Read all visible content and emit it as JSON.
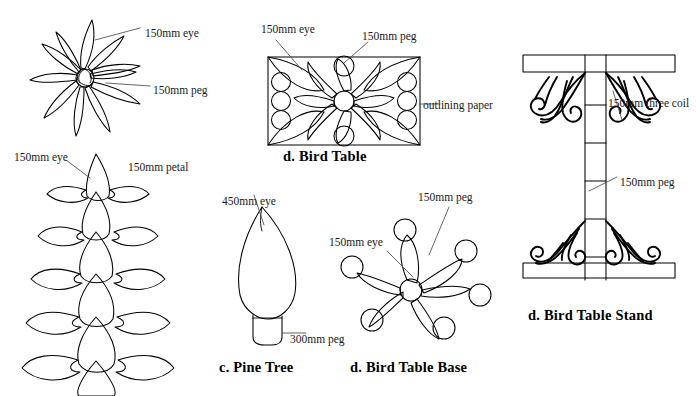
{
  "page": {
    "width": 696,
    "height": 396,
    "background": "#ffffff",
    "ink_color": "#000000",
    "label_color": "#1a1a1a"
  },
  "figures": [
    {
      "id": "star-flower",
      "name": "Star Flower Pattern",
      "labels": [
        {
          "text": "150mm eye",
          "x": 145,
          "y": 28
        },
        {
          "text": "150mm peg",
          "x": 153,
          "y": 85
        }
      ]
    },
    {
      "id": "pine-cone",
      "name": "Pine Cone Petal Pattern",
      "labels": [
        {
          "text": "150mm eye",
          "x": 14,
          "y": 152
        },
        {
          "text": "150mm petal",
          "x": 128,
          "y": 162
        }
      ]
    },
    {
      "id": "bird-table",
      "name": "Bird Table",
      "caption": "d. Bird Table",
      "caption_x": 283,
      "caption_y": 149,
      "labels": [
        {
          "text": "150mm eye",
          "x": 261,
          "y": 24
        },
        {
          "text": "150mm peg",
          "x": 362,
          "y": 31
        },
        {
          "text": "outlining paper",
          "x": 423,
          "y": 100
        }
      ]
    },
    {
      "id": "pine-tree",
      "name": "Pine Tree",
      "caption": "c. Pine Tree",
      "caption_x": 219,
      "caption_y": 360,
      "labels": [
        {
          "text": "450mm eye",
          "x": 222,
          "y": 196
        },
        {
          "text": "300mm peg",
          "x": 290,
          "y": 334
        }
      ]
    },
    {
      "id": "bird-table-base",
      "name": "Bird Table Base",
      "caption": "d. Bird Table Base",
      "caption_x": 350,
      "caption_y": 360,
      "labels": [
        {
          "text": "150mm peg",
          "x": 418,
          "y": 192
        },
        {
          "text": "150mm eye",
          "x": 329,
          "y": 237
        }
      ]
    },
    {
      "id": "bird-table-stand",
      "name": "Bird Table Stand",
      "caption": "d. Bird Table Stand",
      "caption_x": 528,
      "caption_y": 308,
      "labels": [
        {
          "text": "150mm three coil",
          "x": 608,
          "y": 98
        },
        {
          "text": "150mm peg",
          "x": 620,
          "y": 177
        }
      ]
    }
  ]
}
